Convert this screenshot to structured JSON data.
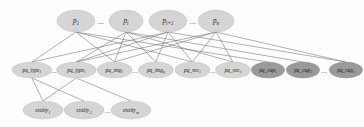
{
  "figure": {
    "background_color": "#fdfdfd",
    "edge_color": "#6f6f6f",
    "node_light_color": "#d5d5d5",
    "node_dark_color": "#9a9a9a",
    "ellipsis": "...",
    "layers": [
      {
        "name": "predicate-layer",
        "row": "top",
        "nodes": [
          {
            "id": "p1",
            "base": "p",
            "sub": "1",
            "x": 76,
            "y": 21,
            "rx": 19,
            "ry": 11,
            "shade": "light"
          },
          {
            "id": "pi",
            "base": "p",
            "sub": "i",
            "x": 126,
            "y": 21,
            "rx": 17,
            "ry": 11,
            "shade": "light"
          },
          {
            "id": "pi1",
            "base": "p",
            "sub": "i+1",
            "x": 168,
            "y": 21,
            "rx": 19,
            "ry": 11,
            "shade": "light"
          },
          {
            "id": "pn",
            "base": "p",
            "sub": "n",
            "x": 216,
            "y": 21,
            "rx": 18,
            "ry": 11,
            "shade": "light"
          }
        ],
        "gaps": [
          {
            "after": "p1",
            "x": 101,
            "y": 21
          },
          {
            "after": "pi1",
            "x": 193,
            "y": 21
          }
        ]
      },
      {
        "name": "property-layer",
        "row": "middle",
        "nodes": [
          {
            "id": "pq_type_1",
            "base": "pq_type",
            "sub": "1",
            "x": 30,
            "y": 70,
            "rx": 25,
            "ry": 8,
            "shade": "light"
          },
          {
            "id": "pq_type_s",
            "base": "pq_type",
            "sub": "s",
            "x": 86,
            "y": 70,
            "rx": 25,
            "ry": 8,
            "shade": "light"
          },
          {
            "id": "pq_img_1",
            "base": "pq_img",
            "sub": "1",
            "x": 134,
            "y": 70,
            "rx": 22,
            "ry": 8,
            "shade": "light"
          },
          {
            "id": "pq_img_q",
            "base": "pq_img",
            "sub": "q",
            "x": 186,
            "y": 70,
            "rx": 22,
            "ry": 8,
            "shade": "light"
          },
          {
            "id": "pq_vec_1",
            "base": "pq_vec",
            "sub": "1",
            "x": 232,
            "y": 70,
            "rx": 22,
            "ry": 8,
            "shade": "light"
          },
          {
            "id": "pq_vec_v",
            "base": "pq_vec",
            "sub": "v",
            "x": 283,
            "y": 70,
            "rx": 22,
            "ry": 8,
            "shade": "light"
          },
          {
            "id": "pq_cap_1",
            "base": "pq_cap",
            "sub": "1",
            "x": 327,
            "y": 70,
            "rx": 21,
            "ry": 8,
            "shade": "dark"
          },
          {
            "id": "pq_cap_2",
            "base": "pq_cap",
            "sub": "2",
            "x": 371,
            "y": 70,
            "rx": 21,
            "ry": 8,
            "shade": "dark"
          },
          {
            "id": "pq_cap_c",
            "base": "pq_cap",
            "sub": "c",
            "x": 425,
            "y": 70,
            "rx": 21,
            "ry": 8,
            "shade": "dark"
          }
        ],
        "gaps": [
          {
            "after": "pq_type_1",
            "x": 58,
            "y": 70
          },
          {
            "after": "pq_img_1",
            "x": 160,
            "y": 70
          },
          {
            "after": "pq_vec_1",
            "x": 258,
            "y": 70
          },
          {
            "after": "pq_cap_2",
            "x": 398,
            "y": 70
          }
        ]
      },
      {
        "name": "entity-layer",
        "row": "bottom",
        "nodes": [
          {
            "id": "entity_1",
            "base": "entity",
            "sub": "1",
            "x": 43,
            "y": 110,
            "rx": 20,
            "ry": 9,
            "shade": "light"
          },
          {
            "id": "entity_2",
            "base": "entity",
            "sub": "2",
            "x": 84,
            "y": 110,
            "rx": 20,
            "ry": 9,
            "shade": "light"
          },
          {
            "id": "entity_m",
            "base": "entity",
            "sub": "m",
            "x": 131,
            "y": 110,
            "rx": 20,
            "ry": 9,
            "shade": "light"
          }
        ],
        "gaps": [
          {
            "after": "entity_2",
            "x": 108,
            "y": 110
          }
        ]
      }
    ],
    "edges_top_to_middle": [
      {
        "from": "p1",
        "to": "pq_type_1"
      },
      {
        "from": "p1",
        "to": "pq_img_1"
      },
      {
        "from": "p1",
        "to": "pq_vec_1"
      },
      {
        "from": "p1",
        "to": "pq_cap_1"
      },
      {
        "from": "pi",
        "to": "pq_type_s"
      },
      {
        "from": "pi",
        "to": "pq_img_1"
      },
      {
        "from": "pi",
        "to": "pq_img_q"
      },
      {
        "from": "pi",
        "to": "pq_vec_v"
      },
      {
        "from": "pi",
        "to": "pq_cap_2"
      },
      {
        "from": "pi1",
        "to": "pq_type_1"
      },
      {
        "from": "pi1",
        "to": "pq_type_s"
      },
      {
        "from": "pi1",
        "to": "pq_img_q"
      },
      {
        "from": "pi1",
        "to": "pq_vec_1"
      },
      {
        "from": "pi1",
        "to": "pq_cap_c"
      },
      {
        "from": "pn",
        "to": "pq_type_s"
      },
      {
        "from": "pn",
        "to": "pq_img_1"
      },
      {
        "from": "pn",
        "to": "pq_vec_1"
      },
      {
        "from": "pn",
        "to": "pq_vec_v"
      },
      {
        "from": "pn",
        "to": "pq_cap_c"
      }
    ],
    "edges_middle_to_bottom": [
      {
        "from": "pq_type_1",
        "to": "entity_1"
      },
      {
        "from": "pq_type_1",
        "to": "entity_2"
      },
      {
        "from": "pq_type_s",
        "to": "entity_1"
      },
      {
        "from": "pq_type_s",
        "to": "entity_m"
      }
    ]
  }
}
